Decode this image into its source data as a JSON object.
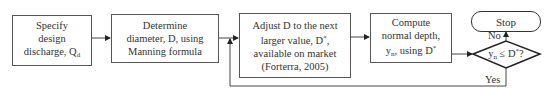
{
  "diagram": {
    "type": "flowchart",
    "steps": [
      {
        "id": "specify",
        "lines": [
          "Specify",
          "design",
          "discharge, Q",
          "d"
        ]
      },
      {
        "id": "determine",
        "lines": [
          "Determine",
          "diameter, D, using",
          "Manning formula"
        ]
      },
      {
        "id": "adjust",
        "lines": [
          "Adjust D to the next",
          "larger value, D",
          "*",
          ",",
          "available on market",
          "(Forterra, 2005)"
        ]
      },
      {
        "id": "compute",
        "lines": [
          "Compute",
          "normal depth,",
          "y",
          "n",
          ", using D",
          "*"
        ]
      }
    ],
    "decision": {
      "text_main": "y",
      "text_sub": "n",
      "text_op": " ≤ D",
      "text_sup": "*",
      "text_end": "?"
    },
    "terminal": {
      "label": "Stop"
    },
    "branches": {
      "no": "No",
      "yes": "Yes"
    },
    "colors": {
      "line": "#333333",
      "box_border": "#555555",
      "background": "#ffffff"
    }
  }
}
